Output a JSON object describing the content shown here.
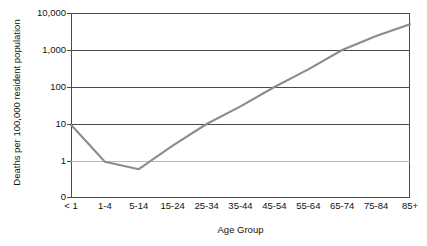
{
  "chart_data": {
    "type": "line",
    "title": "",
    "xlabel": "Age Group",
    "ylabel": "Deaths per 100,000 resident population",
    "categories": [
      "< 1",
      "1-4",
      "5-14",
      "15-24",
      "25-34",
      "35-44",
      "45-54",
      "55-64",
      "65-74",
      "75-84",
      "85+"
    ],
    "series": [
      {
        "name": "Death rate",
        "values": [
          9.5,
          0.95,
          0.6,
          2.6,
          10,
          30,
          100,
          300,
          1000,
          2400,
          5000
        ]
      }
    ],
    "y_scale": "log",
    "y_tick_labels": [
      "10,000",
      "1,000",
      "100",
      "10",
      "1",
      "0"
    ],
    "y_tick_values": [
      10000,
      1000,
      100,
      10,
      1,
      0
    ],
    "ylim": [
      0,
      10000
    ],
    "grid": true,
    "legend": "none",
    "line_color": "#8c8c8c"
  },
  "axes": {
    "y_title": "Deaths per 100,000 resident population",
    "x_title": "Age Group"
  },
  "header": {
    "cropped_title": ""
  }
}
